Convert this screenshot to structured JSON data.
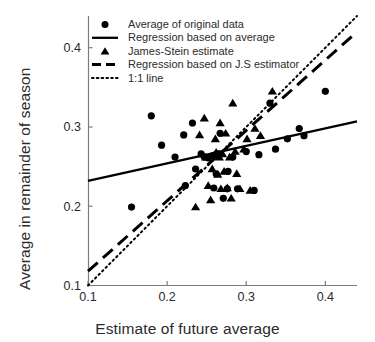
{
  "chart_data": {
    "type": "scatter",
    "title": "",
    "xlabel": "Estimate of future average",
    "ylabel": "Average in remainder of season",
    "xlim": [
      0.1,
      0.44
    ],
    "ylim": [
      0.1,
      0.44
    ],
    "xticks": [
      0.1,
      0.2,
      0.3,
      0.4
    ],
    "xticklabels": [
      "0.1",
      "0.2",
      "0.3",
      "0.4"
    ],
    "yticks": [
      0.1,
      0.2,
      0.3,
      0.4
    ],
    "yticklabels": [
      "0.1",
      "0.2",
      "0.3",
      "0.4"
    ],
    "grid": false,
    "legend_position": "top-left",
    "series": [
      {
        "name": "Average of original data",
        "marker": "circle",
        "color": "#000000",
        "points": [
          [
            0.155,
            0.199
          ],
          [
            0.18,
            0.314
          ],
          [
            0.193,
            0.277
          ],
          [
            0.21,
            0.262
          ],
          [
            0.221,
            0.29
          ],
          [
            0.223,
            0.226
          ],
          [
            0.232,
            0.305
          ],
          [
            0.236,
            0.247
          ],
          [
            0.243,
            0.266
          ],
          [
            0.247,
            0.262
          ],
          [
            0.252,
            0.261
          ],
          [
            0.258,
            0.264
          ],
          [
            0.259,
            0.223
          ],
          [
            0.262,
            0.241
          ],
          [
            0.265,
            0.266
          ],
          [
            0.267,
            0.292
          ],
          [
            0.271,
            0.21
          ],
          [
            0.276,
            0.222
          ],
          [
            0.277,
            0.244
          ],
          [
            0.283,
            0.262
          ],
          [
            0.289,
            0.222
          ],
          [
            0.3,
            0.269
          ],
          [
            0.31,
            0.22
          ],
          [
            0.316,
            0.265
          ],
          [
            0.33,
            0.33
          ],
          [
            0.337,
            0.272
          ],
          [
            0.352,
            0.285
          ],
          [
            0.367,
            0.298
          ],
          [
            0.373,
            0.289
          ],
          [
            0.4,
            0.345
          ]
        ]
      },
      {
        "name": "James-Stein estimate",
        "marker": "triangle",
        "color": "#000000",
        "points": [
          [
            0.236,
            0.199
          ],
          [
            0.241,
            0.29
          ],
          [
            0.247,
            0.311
          ],
          [
            0.249,
            0.262
          ],
          [
            0.252,
            0.226
          ],
          [
            0.255,
            0.208
          ],
          [
            0.257,
            0.247
          ],
          [
            0.259,
            0.264
          ],
          [
            0.261,
            0.285
          ],
          [
            0.262,
            0.268
          ],
          [
            0.264,
            0.24
          ],
          [
            0.266,
            0.262
          ],
          [
            0.267,
            0.305
          ],
          [
            0.268,
            0.222
          ],
          [
            0.27,
            0.266
          ],
          [
            0.272,
            0.244
          ],
          [
            0.274,
            0.292
          ],
          [
            0.276,
            0.223
          ],
          [
            0.279,
            0.262
          ],
          [
            0.281,
            0.21
          ],
          [
            0.283,
            0.33
          ],
          [
            0.286,
            0.269
          ],
          [
            0.288,
            0.241
          ],
          [
            0.292,
            0.222
          ],
          [
            0.297,
            0.272
          ],
          [
            0.301,
            0.285
          ],
          [
            0.305,
            0.22
          ],
          [
            0.311,
            0.298
          ],
          [
            0.318,
            0.289
          ],
          [
            0.333,
            0.345
          ]
        ]
      }
    ],
    "lines": [
      {
        "name": "Regression based on average",
        "style": "solid",
        "color": "#000000",
        "x": [
          0.1,
          0.44
        ],
        "y": [
          0.232,
          0.307
        ]
      },
      {
        "name": "Regression based on J.S estimator",
        "style": "dashed",
        "color": "#000000",
        "x": [
          0.1,
          0.44
        ],
        "y": [
          0.118,
          0.42
        ]
      },
      {
        "name": "1:1 line",
        "style": "dotted",
        "color": "#000000",
        "x": [
          0.1,
          0.44
        ],
        "y": [
          0.1,
          0.44
        ]
      }
    ],
    "legend": [
      {
        "label": "Average of original data",
        "glyph": "circle"
      },
      {
        "label": "Regression based on average",
        "glyph": "solid-line"
      },
      {
        "label": "James-Stein estimate",
        "glyph": "triangle"
      },
      {
        "label": "Regression based on J.S estimator",
        "glyph": "dashed-line"
      },
      {
        "label": "1:1 line",
        "glyph": "dotted-line"
      }
    ]
  }
}
